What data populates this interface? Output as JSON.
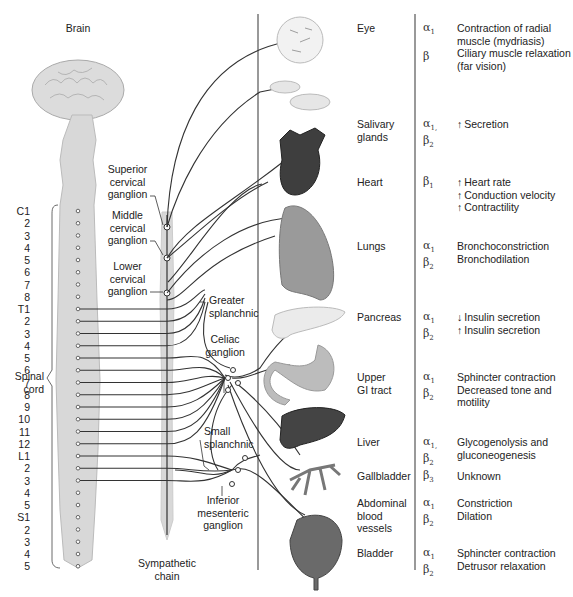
{
  "labels": {
    "brain": "Brain",
    "superior_cervical": [
      "Superior",
      "cervical",
      "ganglion"
    ],
    "middle_cervical": [
      "Middle",
      "cervical",
      "ganglion"
    ],
    "lower_cervical": [
      "Lower",
      "cervical",
      "ganglion"
    ],
    "greater_splanchnic": [
      "Greater",
      "splanchnic"
    ],
    "celiac": [
      "Celiac",
      "ganglion"
    ],
    "small_splanchnic": [
      "Small",
      "splanchnic"
    ],
    "inferior_mesenteric": [
      "Inferior",
      "mesenteric",
      "ganglion"
    ],
    "sympathetic_chain": [
      "Sympathetic",
      "chain"
    ],
    "spinal_cord": [
      "Spinal",
      "cord"
    ]
  },
  "segments": [
    "C1",
    "2",
    "3",
    "4",
    "5",
    "6",
    "7",
    "8",
    "T1",
    "2",
    "3",
    "4",
    "5",
    "6",
    "7",
    "8",
    "9",
    "10",
    "11",
    "12",
    "L1",
    "2",
    "3",
    "4",
    "5",
    "S1",
    "2",
    "3",
    "4",
    "5"
  ],
  "organs": [
    {
      "name": [
        "Eye"
      ],
      "receptors": [
        {
          "r": "α",
          "s": "1"
        },
        {
          "r": "β",
          "s": ""
        }
      ],
      "effects": [
        {
          "arrow": "",
          "text": "Contraction of radial"
        },
        {
          "arrow": "",
          "text": "muscle (mydriasis)"
        },
        {
          "arrow": "",
          "text": "Ciliary muscle relaxation"
        },
        {
          "arrow": "",
          "text": "(far vision)"
        }
      ]
    },
    {
      "name": [
        "Salivary",
        "glands"
      ],
      "receptors": [
        {
          "r": "α",
          "s": "1,"
        },
        {
          "r": "β",
          "s": "2"
        }
      ],
      "effects": [
        {
          "arrow": "↑",
          "text": "Secretion"
        }
      ]
    },
    {
      "name": [
        "Heart"
      ],
      "receptors": [
        {
          "r": "β",
          "s": "1"
        }
      ],
      "effects": [
        {
          "arrow": "↑",
          "text": "Heart rate"
        },
        {
          "arrow": "↑",
          "text": "Conduction velocity"
        },
        {
          "arrow": "↑",
          "text": "Contractility"
        }
      ]
    },
    {
      "name": [
        "Lungs"
      ],
      "receptors": [
        {
          "r": "α",
          "s": "1"
        },
        {
          "r": "β",
          "s": "2"
        }
      ],
      "effects": [
        {
          "arrow": "",
          "text": "Bronchoconstriction"
        },
        {
          "arrow": "",
          "text": "Bronchodilation"
        }
      ]
    },
    {
      "name": [
        "Pancreas"
      ],
      "receptors": [
        {
          "r": "α",
          "s": "1"
        },
        {
          "r": "β",
          "s": "2"
        }
      ],
      "effects": [
        {
          "arrow": "↓",
          "text": "Insulin secretion"
        },
        {
          "arrow": "↑",
          "text": "Insulin secretion"
        }
      ]
    },
    {
      "name": [
        "Upper",
        "GI tract"
      ],
      "receptors": [
        {
          "r": "α",
          "s": "1"
        },
        {
          "r": "β",
          "s": "2"
        }
      ],
      "effects": [
        {
          "arrow": "",
          "text": "Sphincter contraction"
        },
        {
          "arrow": "",
          "text": "Decreased tone and"
        },
        {
          "arrow": "",
          "text": "motility"
        }
      ]
    },
    {
      "name": [
        "Liver"
      ],
      "receptors": [
        {
          "r": "α",
          "s": "1,"
        },
        {
          "r": "β",
          "s": "2"
        }
      ],
      "effects": [
        {
          "arrow": "",
          "text": "Glycogenolysis and"
        },
        {
          "arrow": "",
          "text": "gluconeogenesis"
        }
      ]
    },
    {
      "name": [
        "Gallbladder"
      ],
      "receptors": [
        {
          "r": "β",
          "s": "3"
        }
      ],
      "effects": [
        {
          "arrow": "",
          "text": "Unknown"
        }
      ]
    },
    {
      "name": [
        "Abdominal",
        "blood",
        "vessels"
      ],
      "receptors": [
        {
          "r": "α",
          "s": "1"
        },
        {
          "r": "β",
          "s": "2"
        }
      ],
      "effects": [
        {
          "arrow": "",
          "text": "Constriction"
        },
        {
          "arrow": "",
          "text": "Dilation"
        }
      ]
    },
    {
      "name": [
        "Bladder"
      ],
      "receptors": [
        {
          "r": "α",
          "s": "1"
        },
        {
          "r": "β",
          "s": "2"
        }
      ],
      "effects": [
        {
          "arrow": "",
          "text": "Sphincter contraction"
        },
        {
          "arrow": "",
          "text": "Detrusor relaxation"
        }
      ]
    }
  ],
  "colors": {
    "line": "#333333",
    "tissue_light": "#d9d9d9",
    "tissue_dark": "#555555",
    "divider": "#555555"
  }
}
